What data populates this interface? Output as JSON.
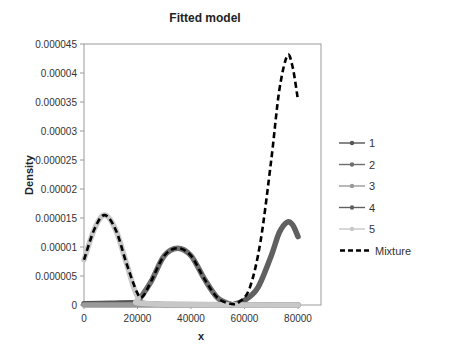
{
  "chart_data": {
    "type": "line",
    "title": "Fitted model",
    "xlabel": "x",
    "ylabel": "Density",
    "xlim": [
      0,
      80000
    ],
    "ylim": [
      0,
      4.5e-05
    ],
    "x_ticks": [
      "0",
      "20000",
      "40000",
      "60000",
      "80000"
    ],
    "y_ticks": [
      "0",
      "0.000005",
      "0.00001",
      "0.000015",
      "0.00002",
      "0.000025",
      "0.00003",
      "0.000035",
      "0.00004",
      "0.000045"
    ],
    "grid": false,
    "legend_position": "right",
    "series": [
      {
        "name": "1",
        "color": "#555555",
        "description": "near zero across the range",
        "x": [
          0,
          10000,
          20000,
          30000,
          80000
        ],
        "y": [
          2e-07,
          3e-07,
          4e-07,
          1e-07,
          0
        ]
      },
      {
        "name": "2",
        "color": "#6e6e6e",
        "description": "bell-shaped component centered ~35000",
        "x": [
          20000,
          25000,
          30000,
          35000,
          40000,
          45000,
          50000,
          55000
        ],
        "y": [
          5e-07,
          4e-06,
          8.5e-06,
          9.8e-06,
          8.5e-06,
          4.5e-06,
          1.2e-06,
          1e-07
        ]
      },
      {
        "name": "3",
        "color": "#9a9a9a",
        "description": "near zero across the range",
        "x": [
          0,
          80000
        ],
        "y": [
          0,
          0
        ]
      },
      {
        "name": "4",
        "color": "#606060",
        "description": "rising component peaking ~76000",
        "x": [
          55000,
          60000,
          65000,
          70000,
          73000,
          76000,
          78000,
          80000
        ],
        "y": [
          0,
          8e-07,
          3e-06,
          8.5e-06,
          1.25e-05,
          1.43e-05,
          1.38e-05,
          1.18e-05
        ]
      },
      {
        "name": "5",
        "color": "#c8c8c8",
        "description": "bell-shaped component centered ~7800",
        "x": [
          0,
          4000,
          7800,
          12000,
          16000,
          20000,
          25000,
          80000
        ],
        "y": [
          7.8e-06,
          1.32e-05,
          1.55e-05,
          1.28e-05,
          7e-06,
          1.5e-06,
          2e-07,
          0
        ]
      },
      {
        "name": "Mixture",
        "color": "#000000",
        "style": "dashed",
        "x": [
          0,
          4000,
          7800,
          12000,
          16000,
          20000,
          22000,
          25000,
          30000,
          35000,
          40000,
          45000,
          50000,
          55000,
          58000,
          62000,
          66000,
          70000,
          73000,
          76000,
          78000,
          80000
        ],
        "y": [
          7.8e-06,
          1.32e-05,
          1.55e-05,
          1.28e-05,
          7e-06,
          2e-06,
          1.5e-06,
          4e-06,
          8.5e-06,
          9.8e-06,
          8.5e-06,
          4.5e-06,
          1.2e-06,
          2e-07,
          5e-07,
          3e-06,
          1.1e-05,
          2.5e-05,
          3.7e-05,
          4.3e-05,
          4.1e-05,
          3.53e-05
        ]
      }
    ]
  },
  "legend": {
    "items": [
      {
        "label": "1",
        "color": "#555555"
      },
      {
        "label": "2",
        "color": "#6e6e6e"
      },
      {
        "label": "3",
        "color": "#9a9a9a"
      },
      {
        "label": "4",
        "color": "#606060"
      },
      {
        "label": "5",
        "color": "#c8c8c8"
      },
      {
        "label": "Mixture",
        "color": "#000000"
      }
    ]
  }
}
